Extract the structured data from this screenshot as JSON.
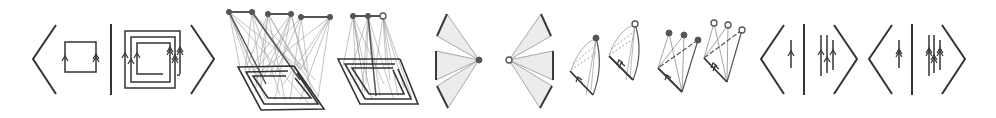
{
  "diagram": {
    "colors": {
      "ink": "#333333",
      "projection_lines": "#9a9a9a",
      "fan_fill": "#ececec",
      "vertex": "#555555",
      "background": "#ffffff"
    },
    "panels": [
      {
        "id": "bracket-loops",
        "type": "angle-bracket pairing",
        "left": "single square loop, arrows single/double",
        "right": "nested spiral loop with 3 turns",
        "x_range": [
          30,
          215
        ]
      },
      {
        "id": "lifted-spiral-3",
        "type": "3D projection",
        "top_vertices": 6,
        "vertex_style": "filled",
        "x_range": [
          225,
          335
        ]
      },
      {
        "id": "lifted-spiral-2",
        "type": "3D projection",
        "top_vertices": 3,
        "vertex_style": "2 filled, 1 open",
        "x_range": [
          335,
          415
        ]
      },
      {
        "id": "fan-filled",
        "type": "fan",
        "wedges": 3,
        "vertex_style": "filled",
        "x_range": [
          435,
          480
        ]
      },
      {
        "id": "fan-open",
        "type": "fan",
        "wedges": 3,
        "vertex_style": "open",
        "x_range": [
          505,
          555
        ]
      },
      {
        "id": "cone-filled",
        "type": "cone surface",
        "vertex_style": "filled",
        "x_range": [
          565,
          605
        ]
      },
      {
        "id": "cone-open",
        "type": "cone surface",
        "vertex_style": "open",
        "x_range": [
          605,
          645
        ]
      },
      {
        "id": "tripod-filled",
        "type": "tripod",
        "vertices": 3,
        "vertex_style": "filled",
        "x_range": [
          655,
          700
        ]
      },
      {
        "id": "tripod-open",
        "type": "tripod",
        "vertices": 3,
        "vertex_style": "open",
        "x_range": [
          700,
          745
        ]
      },
      {
        "id": "bracket-lines-single",
        "type": "angle-bracket pairing",
        "left": "1 vertical line, single arrow",
        "right": "3 vertical lines, single arrows",
        "x_range": [
          760,
          858
        ]
      },
      {
        "id": "bracket-lines-double",
        "type": "angle-bracket pairing",
        "left": "1 vertical line, double arrow",
        "right": "3 vertical lines, double arrows",
        "x_range": [
          868,
          965
        ]
      }
    ]
  }
}
